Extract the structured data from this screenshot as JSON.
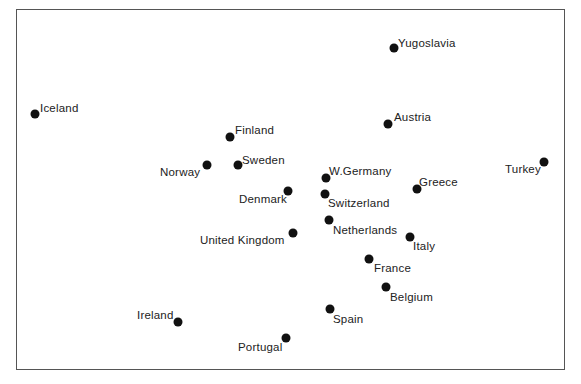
{
  "chart_data": {
    "type": "scatter",
    "title": "",
    "xlabel": "",
    "ylabel": "",
    "grid": false,
    "legend": null,
    "points": [
      {
        "label": "Yugoslavia",
        "x": 394,
        "y": 48,
        "lx": 398,
        "ly": 38,
        "anchor": "left"
      },
      {
        "label": "Iceland",
        "x": 35,
        "y": 114,
        "lx": 40,
        "ly": 103,
        "anchor": "left"
      },
      {
        "label": "Austria",
        "x": 388,
        "y": 124,
        "lx": 394,
        "ly": 112,
        "anchor": "left"
      },
      {
        "label": "Finland",
        "x": 230,
        "y": 137,
        "lx": 235,
        "ly": 125,
        "anchor": "left"
      },
      {
        "label": "Norway",
        "x": 207,
        "y": 165,
        "lx": 160,
        "ly": 167,
        "anchor": "left"
      },
      {
        "label": "Sweden",
        "x": 238,
        "y": 165,
        "lx": 242,
        "ly": 155,
        "anchor": "left"
      },
      {
        "label": "Turkey",
        "x": 544,
        "y": 162,
        "lx": 505,
        "ly": 164,
        "anchor": "left"
      },
      {
        "label": "W.Germany",
        "x": 326,
        "y": 178,
        "lx": 329,
        "ly": 166,
        "anchor": "left"
      },
      {
        "label": "Greece",
        "x": 417,
        "y": 189,
        "lx": 419,
        "ly": 177,
        "anchor": "left"
      },
      {
        "label": "Denmark",
        "x": 288,
        "y": 191,
        "lx": 239,
        "ly": 194,
        "anchor": "left"
      },
      {
        "label": "Switzerland",
        "x": 325,
        "y": 194,
        "lx": 328,
        "ly": 198,
        "anchor": "left"
      },
      {
        "label": "Netherlands",
        "x": 329,
        "y": 220,
        "lx": 333,
        "ly": 225,
        "anchor": "left"
      },
      {
        "label": "United Kingdom",
        "x": 293,
        "y": 233,
        "lx": 200,
        "ly": 235,
        "anchor": "left"
      },
      {
        "label": "Italy",
        "x": 410,
        "y": 237,
        "lx": 413,
        "ly": 241,
        "anchor": "left"
      },
      {
        "label": "France",
        "x": 369,
        "y": 259,
        "lx": 374,
        "ly": 263,
        "anchor": "left"
      },
      {
        "label": "Belgium",
        "x": 386,
        "y": 287,
        "lx": 390,
        "ly": 292,
        "anchor": "left"
      },
      {
        "label": "Spain",
        "x": 330,
        "y": 309,
        "lx": 333,
        "ly": 314,
        "anchor": "left"
      },
      {
        "label": "Ireland",
        "x": 178,
        "y": 322,
        "lx": 137,
        "ly": 310,
        "anchor": "left"
      },
      {
        "label": "Portugal",
        "x": 286,
        "y": 338,
        "lx": 238,
        "ly": 342,
        "anchor": "left"
      }
    ]
  }
}
